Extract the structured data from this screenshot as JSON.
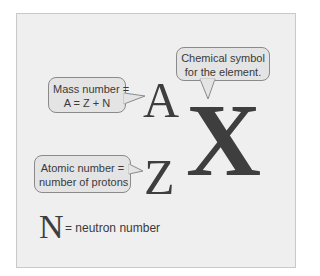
{
  "diagram": {
    "symbols": {
      "mass_number": "A",
      "atomic_number": "Z",
      "element": "X",
      "neutron": "N"
    },
    "callouts": {
      "element": {
        "line1": "Chemical symbol",
        "line2": "for the element."
      },
      "mass": {
        "line1": "Mass number =",
        "line2": "A = Z + N"
      },
      "atomic": {
        "line1": "Atomic number =",
        "line2": "number of protons"
      }
    },
    "legend": {
      "symbol": "N",
      "text": "= neutron number"
    },
    "colors": {
      "frame_bg": "#efefef",
      "frame_border": "#c9c9c9",
      "callout_bg": "#e4e4e4",
      "callout_border": "#8a8a8a",
      "glyph": "#3e3e3e"
    }
  }
}
